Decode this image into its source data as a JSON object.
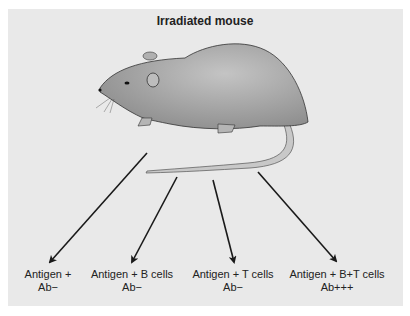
{
  "title": "Irradiated mouse",
  "groups": [
    {
      "line1": "Antigen +",
      "line2": "Ab−"
    },
    {
      "line1": "Antigen + B cells",
      "line2": "Ab−"
    },
    {
      "line1": "Antigen + T cells",
      "line2": "Ab−"
    },
    {
      "line1": "Antigen + B+T cells",
      "line2": "Ab+++"
    }
  ],
  "colors": {
    "panel": "#e9e9e9",
    "mouse_body": "#a9a9a9",
    "tail": "#c8c8c8",
    "arrow": "#1a1a1a"
  }
}
